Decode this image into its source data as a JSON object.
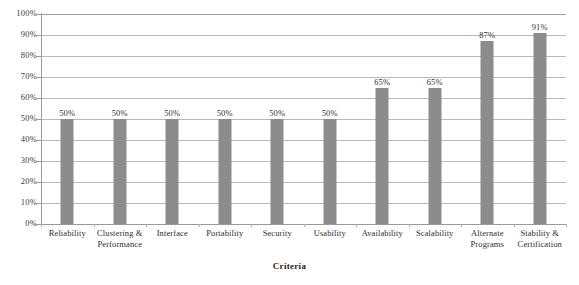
{
  "chart_data": {
    "type": "bar",
    "title": "",
    "xlabel": "Criteria",
    "ylabel": "",
    "ylim": [
      0,
      100
    ],
    "grid": true,
    "legend": "none",
    "orientation": "vertical",
    "bar_color": "#8c8c8c",
    "gridline_color": "#b9b9b9",
    "axis_color": "#9a9a9a",
    "categories": [
      "Reliability",
      "Clustering & Performance",
      "Interface",
      "Portability",
      "Security",
      "Usability",
      "Availability",
      "Scalability",
      "Alternate Programs",
      "Stability & Certification"
    ],
    "values": [
      50,
      50,
      50,
      50,
      50,
      50,
      65,
      65,
      87,
      91
    ],
    "value_labels": [
      "50%",
      "50%",
      "50%",
      "50%",
      "50%",
      "50%",
      "65%",
      "65%",
      "87%",
      "91%"
    ],
    "ytick_labels": [
      "100%",
      "90%",
      "80%",
      "70%",
      "60%",
      "50%",
      "40%",
      "30%",
      "20%",
      "10%",
      "0%"
    ],
    "ytick_values": [
      100,
      90,
      80,
      70,
      60,
      50,
      40,
      30,
      20,
      10,
      0
    ]
  }
}
